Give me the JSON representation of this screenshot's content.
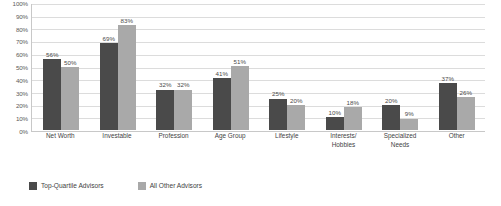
{
  "chart_data": {
    "type": "bar",
    "title": "",
    "subtitle": "",
    "xlabel": "",
    "ylabel": "",
    "ylim": [
      0,
      100
    ],
    "yticks": [
      "0%",
      "10%",
      "20%",
      "30%",
      "40%",
      "50%",
      "60%",
      "70%",
      "80%",
      "90%",
      "100%"
    ],
    "grid": true,
    "legend_position": "bottom-left",
    "categories": [
      "Net Worth",
      "Investable",
      "Profession",
      "Age Group",
      "Lifestyle",
      "Interests/\nHobbies",
      "Specialized\nNeeds",
      "Other"
    ],
    "series": [
      {
        "name": "Top-Quartile Advisors",
        "color": "#4a4a4a",
        "values": [
          56,
          69,
          32,
          41,
          25,
          10,
          20,
          37
        ],
        "labels": [
          "56%",
          "69%",
          "32%",
          "41%",
          "25%",
          "10%",
          "20%",
          "37%"
        ]
      },
      {
        "name": "All Other Advisors",
        "color": "#a9a9a9",
        "values": [
          50,
          83,
          32,
          51,
          20,
          18,
          9,
          26
        ],
        "labels": [
          "50%",
          "83%",
          "32%",
          "51%",
          "20%",
          "18%",
          "9%",
          "26%"
        ]
      }
    ]
  },
  "axis": {
    "y_ticks": [
      {
        "label": "100%",
        "value": 100
      },
      {
        "label": "90%",
        "value": 90
      },
      {
        "label": "80%",
        "value": 80
      },
      {
        "label": "70%",
        "value": 70
      },
      {
        "label": "60%",
        "value": 60
      },
      {
        "label": "50%",
        "value": 50
      },
      {
        "label": "40%",
        "value": 40
      },
      {
        "label": "30%",
        "value": 30
      },
      {
        "label": "20%",
        "value": 20
      },
      {
        "label": "10%",
        "value": 10
      },
      {
        "label": "0%",
        "value": 0
      }
    ]
  },
  "categories": [
    {
      "label": "Net Worth"
    },
    {
      "label": "Investable"
    },
    {
      "label": "Profession"
    },
    {
      "label": "Age Group"
    },
    {
      "label": "Lifestyle"
    },
    {
      "label": "Interests/\nHobbies"
    },
    {
      "label": "Specialized\nNeeds"
    },
    {
      "label": "Other"
    }
  ],
  "legend": {
    "items": [
      {
        "label": "Top-Quartile Advisors",
        "color": "#4a4a4a"
      },
      {
        "label": "All Other Advisors",
        "color": "#a9a9a9"
      }
    ]
  }
}
